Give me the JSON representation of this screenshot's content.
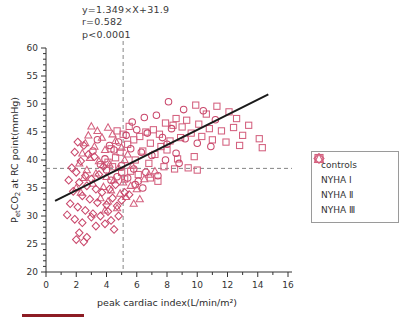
{
  "annotations": {
    "equation": "y=1.349×X+31.9",
    "correlation": "r=0.582",
    "pvalue": "p<0.0001"
  },
  "legend": {
    "items": [
      {
        "marker": "square-marker",
        "label": "controls"
      },
      {
        "marker": "circle-marker",
        "label": "NYHA Ⅰ"
      },
      {
        "marker": "triangle-marker",
        "label": "NYHA Ⅱ"
      },
      {
        "marker": "diamond-marker",
        "label": "NYHA Ⅲ"
      }
    ]
  },
  "colors": {
    "marker_stroke": "#d4617f",
    "marker_stroke_alt": "#c9476b",
    "regression_line": "#1a1a1a",
    "reference_line": "#777777",
    "axis": "#333333",
    "caption_rule": "#8d1c24"
  },
  "chart_data": {
    "type": "scatter",
    "title": "",
    "xlabel": "peak cardiac index(L/min/m²)",
    "ylabel": "PетCO₂ at RC point(mmHg)",
    "ylabel_parts": {
      "main": "P",
      "sub": "et",
      "rest": "CO",
      "sub2": "2",
      "tail": " at RC point(mmHg)"
    },
    "xlim": [
      0,
      16
    ],
    "ylim": [
      20,
      60
    ],
    "xticks": [
      0,
      2,
      4,
      6,
      8,
      10,
      12,
      14,
      16
    ],
    "yticks": [
      20,
      25,
      30,
      35,
      40,
      45,
      50,
      55,
      60
    ],
    "x_minor_step": 1,
    "y_minor_step": 1,
    "grid": false,
    "legend_position": "right-outside",
    "regression": {
      "slope": 1.349,
      "intercept": 31.9,
      "r": 0.582,
      "p": "<0.0001",
      "x_start": 0.6,
      "x_end": 14.7
    },
    "reference_lines": [
      {
        "orientation": "horizontal",
        "value": 38.5,
        "style": "dashed"
      },
      {
        "orientation": "vertical",
        "value": 5.1,
        "style": "dashed"
      }
    ],
    "series": [
      {
        "name": "controls",
        "marker": "square",
        "points": [
          [
            9.9,
            49.8
          ],
          [
            11.3,
            49.6
          ],
          [
            10.6,
            48.2
          ],
          [
            12.1,
            48.6
          ],
          [
            8.6,
            47.4
          ],
          [
            9.3,
            47.1
          ],
          [
            7.9,
            46.6
          ],
          [
            8.4,
            46.2
          ],
          [
            9.0,
            45.9
          ],
          [
            10.1,
            46.4
          ],
          [
            10.8,
            45.6
          ],
          [
            11.6,
            45.2
          ],
          [
            12.4,
            45.8
          ],
          [
            13.0,
            44.4
          ],
          [
            14.1,
            43.8
          ],
          [
            14.3,
            42.2
          ],
          [
            12.8,
            42.6
          ],
          [
            11.9,
            43.2
          ],
          [
            11.0,
            43.6
          ],
          [
            10.3,
            44.2
          ],
          [
            9.6,
            44.8
          ],
          [
            8.9,
            44.0
          ],
          [
            8.2,
            43.4
          ],
          [
            7.5,
            44.6
          ],
          [
            7.1,
            45.4
          ],
          [
            6.6,
            45.0
          ],
          [
            6.2,
            44.2
          ],
          [
            6.9,
            43.0
          ],
          [
            7.6,
            42.4
          ],
          [
            8.0,
            41.8
          ],
          [
            5.8,
            43.6
          ],
          [
            5.4,
            42.8
          ],
          [
            6.4,
            41.6
          ],
          [
            7.2,
            41.0
          ],
          [
            8.7,
            40.2
          ],
          [
            9.8,
            40.6
          ],
          [
            5.9,
            40.0
          ],
          [
            6.8,
            39.4
          ],
          [
            7.8,
            38.8
          ],
          [
            8.5,
            38.4
          ],
          [
            9.4,
            38.6
          ],
          [
            10.0,
            38.2
          ],
          [
            5.6,
            38.0
          ],
          [
            6.1,
            37.4
          ],
          [
            6.9,
            36.8
          ],
          [
            7.4,
            36.2
          ],
          [
            5.2,
            36.6
          ],
          [
            5.0,
            37.8
          ],
          [
            4.6,
            40.4
          ],
          [
            4.9,
            41.4
          ],
          [
            4.3,
            42.0
          ],
          [
            5.1,
            44.6
          ],
          [
            4.7,
            45.2
          ],
          [
            5.5,
            46.0
          ],
          [
            4.4,
            38.8
          ],
          [
            4.1,
            39.6
          ],
          [
            12.6,
            47.4
          ],
          [
            13.4,
            46.2
          ]
        ]
      },
      {
        "name": "NYHA I",
        "marker": "circle",
        "points": [
          [
            8.1,
            50.4
          ],
          [
            9.1,
            49.0
          ],
          [
            10.4,
            48.8
          ],
          [
            11.2,
            47.2
          ],
          [
            7.3,
            48.0
          ],
          [
            6.5,
            47.6
          ],
          [
            5.7,
            46.8
          ],
          [
            6.0,
            45.4
          ],
          [
            6.7,
            44.8
          ],
          [
            7.7,
            44.0
          ],
          [
            8.3,
            45.6
          ],
          [
            9.2,
            43.8
          ],
          [
            10.0,
            43.0
          ],
          [
            10.9,
            42.4
          ],
          [
            5.3,
            44.4
          ],
          [
            4.8,
            43.2
          ],
          [
            5.6,
            42.0
          ],
          [
            6.3,
            41.4
          ],
          [
            7.0,
            40.8
          ],
          [
            7.9,
            40.0
          ],
          [
            8.8,
            39.4
          ],
          [
            4.5,
            41.8
          ],
          [
            4.2,
            42.6
          ],
          [
            3.9,
            40.2
          ],
          [
            5.0,
            39.0
          ],
          [
            5.8,
            38.4
          ],
          [
            6.6,
            37.8
          ],
          [
            7.4,
            37.2
          ],
          [
            4.0,
            38.2
          ],
          [
            3.6,
            39.2
          ],
          [
            5.4,
            36.8
          ],
          [
            6.1,
            36.2
          ],
          [
            4.7,
            37.0
          ],
          [
            4.3,
            36.4
          ],
          [
            8.0,
            42.8
          ],
          [
            8.6,
            41.2
          ],
          [
            3.4,
            43.6
          ],
          [
            3.1,
            41.6
          ],
          [
            5.9,
            35.6
          ],
          [
            6.4,
            35.0
          ]
        ]
      },
      {
        "name": "NYHA II",
        "marker": "triangle",
        "points": [
          [
            3.0,
            46.0
          ],
          [
            3.4,
            45.2
          ],
          [
            2.8,
            44.4
          ],
          [
            3.7,
            44.0
          ],
          [
            4.1,
            45.8
          ],
          [
            4.4,
            44.6
          ],
          [
            2.6,
            43.0
          ],
          [
            3.2,
            42.4
          ],
          [
            3.9,
            41.8
          ],
          [
            4.6,
            43.4
          ],
          [
            5.0,
            42.2
          ],
          [
            5.4,
            41.0
          ],
          [
            2.4,
            41.2
          ],
          [
            2.9,
            40.4
          ],
          [
            3.5,
            39.8
          ],
          [
            4.2,
            39.2
          ],
          [
            4.8,
            38.6
          ],
          [
            5.2,
            40.0
          ],
          [
            5.7,
            39.0
          ],
          [
            2.2,
            39.4
          ],
          [
            2.7,
            38.2
          ],
          [
            3.3,
            37.6
          ],
          [
            4.0,
            37.0
          ],
          [
            4.5,
            36.4
          ],
          [
            5.1,
            36.0
          ],
          [
            5.6,
            35.4
          ],
          [
            2.5,
            36.8
          ],
          [
            3.1,
            35.8
          ],
          [
            3.8,
            35.2
          ],
          [
            4.3,
            34.6
          ],
          [
            4.9,
            34.0
          ],
          [
            5.3,
            33.4
          ],
          [
            6.0,
            34.8
          ],
          [
            6.5,
            36.6
          ],
          [
            3.6,
            33.2
          ],
          [
            4.1,
            32.6
          ],
          [
            2.3,
            34.2
          ],
          [
            2.0,
            35.0
          ],
          [
            6.2,
            33.0
          ],
          [
            5.8,
            32.2
          ],
          [
            4.7,
            31.4
          ],
          [
            3.9,
            31.0
          ],
          [
            6.8,
            37.4
          ],
          [
            7.2,
            38.0
          ]
        ]
      },
      {
        "name": "NYHA III",
        "marker": "diamond",
        "points": [
          [
            2.1,
            43.2
          ],
          [
            2.5,
            42.6
          ],
          [
            1.9,
            41.4
          ],
          [
            2.8,
            41.0
          ],
          [
            3.2,
            40.6
          ],
          [
            2.3,
            39.8
          ],
          [
            1.7,
            38.6
          ],
          [
            2.0,
            37.8
          ],
          [
            2.6,
            37.2
          ],
          [
            3.0,
            36.6
          ],
          [
            3.5,
            37.4
          ],
          [
            3.8,
            38.8
          ],
          [
            2.2,
            36.0
          ],
          [
            2.7,
            35.4
          ],
          [
            3.3,
            34.8
          ],
          [
            3.7,
            34.2
          ],
          [
            4.2,
            34.8
          ],
          [
            4.6,
            35.6
          ],
          [
            1.8,
            34.4
          ],
          [
            2.4,
            33.6
          ],
          [
            2.9,
            33.0
          ],
          [
            3.4,
            32.4
          ],
          [
            4.0,
            32.0
          ],
          [
            4.4,
            33.2
          ],
          [
            1.6,
            32.2
          ],
          [
            2.1,
            31.6
          ],
          [
            2.6,
            31.0
          ],
          [
            3.1,
            30.4
          ],
          [
            3.6,
            30.0
          ],
          [
            4.1,
            30.8
          ],
          [
            4.7,
            31.8
          ],
          [
            5.0,
            32.8
          ],
          [
            1.4,
            30.2
          ],
          [
            1.9,
            29.4
          ],
          [
            2.4,
            28.8
          ],
          [
            3.0,
            29.8
          ],
          [
            2.2,
            27.0
          ],
          [
            2.7,
            26.2
          ],
          [
            3.3,
            28.2
          ],
          [
            3.9,
            28.6
          ],
          [
            4.3,
            29.2
          ],
          [
            4.8,
            30.0
          ],
          [
            1.5,
            36.4
          ],
          [
            5.2,
            34.2
          ],
          [
            5.5,
            33.8
          ],
          [
            2.0,
            25.8
          ],
          [
            2.5,
            25.4
          ],
          [
            4.5,
            27.6
          ]
        ]
      }
    ]
  }
}
